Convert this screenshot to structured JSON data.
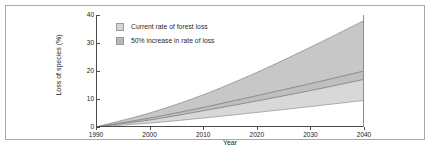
{
  "figure": {
    "border_color": "#a8a8a8"
  },
  "chart_data": {
    "type": "area",
    "title": "",
    "xlabel": "Year",
    "ylabel": "Loss of species (%)",
    "xlim": [
      1990,
      2040
    ],
    "ylim": [
      0,
      40
    ],
    "xticks": [
      "1990",
      "2000",
      "2010",
      "2020",
      "2030",
      "2040"
    ],
    "xtick_values": [
      1990,
      2000,
      2010,
      2020,
      2030,
      2040
    ],
    "yticks": [
      "0",
      "10",
      "20",
      "30",
      "40"
    ],
    "ytick_values": [
      0,
      10,
      20,
      30,
      40
    ],
    "grid": false,
    "legend_position": "upper-left",
    "x": [
      1990,
      2000,
      2010,
      2020,
      2030,
      2040
    ],
    "series": [
      {
        "name": "Current rate of forest loss",
        "kind": "band",
        "color": "#d2d2d2",
        "upper": [
          0,
          3.2,
          7.0,
          11.2,
          15.5,
          20.0
        ],
        "lower": [
          0,
          1.4,
          3.2,
          5.2,
          7.3,
          9.5
        ]
      },
      {
        "name": "50% increase in rate of loss",
        "kind": "band",
        "color": "#b4b4b4",
        "upper": [
          0,
          5.0,
          11.5,
          19.5,
          28.5,
          38.0
        ],
        "lower": [
          0,
          2.5,
          5.8,
          9.3,
          13.0,
          17.0
        ]
      }
    ],
    "legend": [
      {
        "label": "Current rate of forest loss",
        "color": "#d4d4d4"
      },
      {
        "label": "50% increase in rate of loss",
        "color": "#b8b8b8"
      }
    ]
  }
}
